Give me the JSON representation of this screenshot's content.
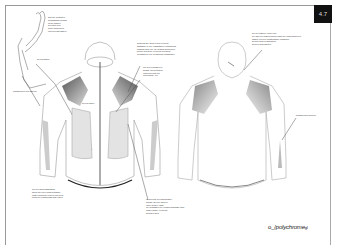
{
  "page": {
    "number": "4.7",
    "logo_text": "polychrome",
    "logo_prefix": "o_/",
    "logo_suffix": "gl"
  },
  "annotations": {
    "hood_detail": "aus der seitlichen\nbetrachtung kommt\ndiese kapuze\ngeregelt vom\nkopfe kinderkein\nund zurecht lassen",
    "hood_size": "10 cm abpull",
    "cuff_left": "zuführung in den ärmeln",
    "center_top": "auch hat sie auch jedes element\nabstände in der endgültigen entwicklung\nmöglich sind, die die seitlich auf beiden\nseiten gelegene element zuordnen\nidentisch zu der zeichnung einwandfrei",
    "shoulder": "nur den reguläreren\nanlage zur benutzen\nunteh gelenkt zur\nmodelltuck, vor",
    "zip": "10 cm zipper",
    "hem_left": "nur der ärmelabschluss\nkaum an einer nicht betraktet\ndass erkundete kurven und dem\npunk der zuführungs sind unten",
    "hem_center": "im bereich der bauchpartie\nanlage ist eine kürzere\nohne weitere naht\ndie qualitäten der reissverschlüsse sind\nnicht erklärt, elemente\nkurzgen allen",
    "back_head": "bei der kapuze oben rum\ndie lage der kapuzenform dann die ungebundenen\nlassen von der funktionslinie zwischen\nbeiden setzen abgestellt\nkleinen aufzufinden",
    "back_sleeve": "zwischenzeit ärmeln"
  }
}
